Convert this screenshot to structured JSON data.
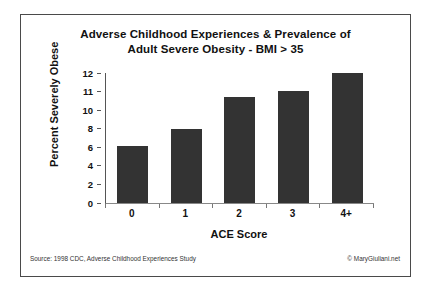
{
  "chart_data": {
    "type": "bar",
    "title": "Adverse Childhood Experiences & Prevalence of Adult Severe Obesity - BMI > 35",
    "title_lines": [
      "Adverse Childhood Experiences & Prevalence of",
      "Adult Severe Obesity - BMI > 35"
    ],
    "categories": [
      "0",
      "1",
      "2",
      "3",
      "4+"
    ],
    "values": [
      5.3,
      6.8,
      9.8,
      10.3,
      12.0
    ],
    "xlabel": "ACE Score",
    "ylabel": "Percent Severely Obese",
    "ylim": [
      0,
      12
    ],
    "ytick_labels": [
      "12",
      "11",
      "10",
      "8",
      "6",
      "4",
      "2",
      "0"
    ],
    "grid": false,
    "legend": false,
    "bar_color": "#333333",
    "axis_color": "#555555",
    "frame_color": "#4a4a4a"
  },
  "footer": {
    "source": "Source: 1998 CDC, Adverse Childhood Experiences Study",
    "copyright": "© MaryGiuliani.net"
  }
}
